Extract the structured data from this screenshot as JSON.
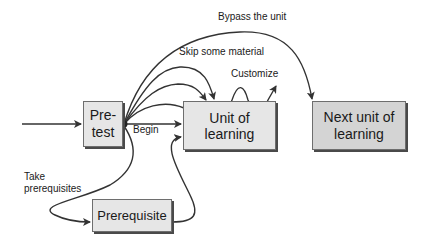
{
  "diagram": {
    "nodes": {
      "pretest": {
        "line1": "Pre-",
        "line2": "test"
      },
      "unit": {
        "label": "Unit of learning"
      },
      "next_unit": {
        "line1": "Next unit of",
        "line2": "learning"
      },
      "prerequisite": {
        "label": "Prerequisite"
      }
    },
    "edges": {
      "bypass": "Bypass the unit",
      "skip": "Skip some material",
      "customize": "Customize",
      "begin": "Begin",
      "take_prereq_line1": "Take",
      "take_prereq_line2": "prerequisites"
    },
    "colors": {
      "box_fill": "#e6e6e6",
      "next_box_fill": "#d4d4d4",
      "stroke": "#333333",
      "shadow": "#4a4a4a"
    }
  }
}
